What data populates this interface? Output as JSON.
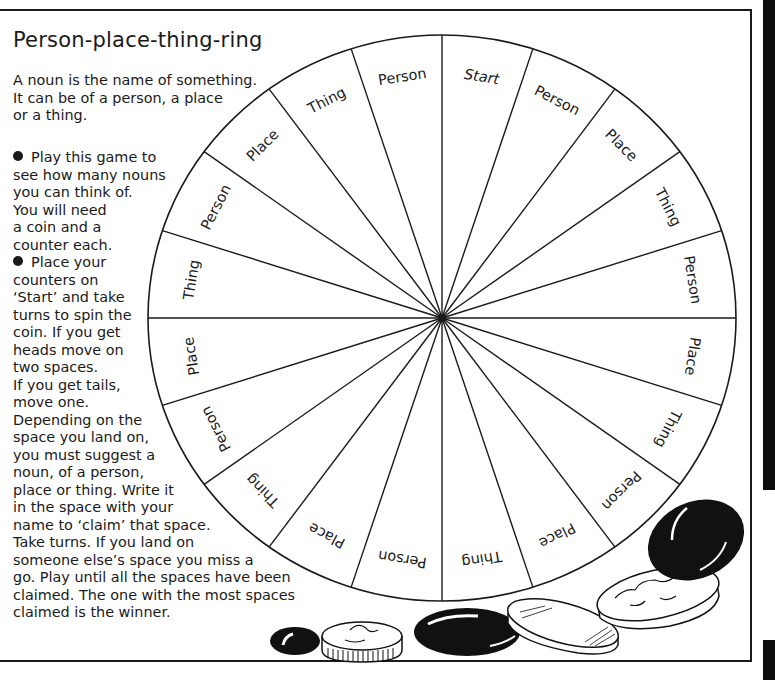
{
  "title": "Person-place-thing-ring",
  "intro_lines": [
    "A noun is the name of something.",
    "It can be of a person, a place",
    "or a thing."
  ],
  "rules_lines": [
    {
      "bullet": true,
      "text": "Play this game to"
    },
    {
      "bullet": false,
      "text": "see how many nouns"
    },
    {
      "bullet": false,
      "text": "you can think of."
    },
    {
      "bullet": false,
      "text": "You will need"
    },
    {
      "bullet": false,
      "text": "a coin and a"
    },
    {
      "bullet": false,
      "text": "counter each."
    },
    {
      "bullet": true,
      "text": "Place your"
    },
    {
      "bullet": false,
      "text": "counters on"
    },
    {
      "bullet": false,
      "text": "‘Start’ and take"
    },
    {
      "bullet": false,
      "text": "turns to spin the"
    },
    {
      "bullet": false,
      "text": "coin. If you get"
    },
    {
      "bullet": false,
      "text": "heads move on"
    },
    {
      "bullet": false,
      "text": "two spaces."
    },
    {
      "bullet": false,
      "text": "If you get tails,"
    },
    {
      "bullet": false,
      "text": "move one."
    },
    {
      "bullet": false,
      "text": "Depending on the"
    },
    {
      "bullet": false,
      "text": "space you land on,"
    },
    {
      "bullet": false,
      "text": "you must suggest a"
    },
    {
      "bullet": false,
      "text": "noun, of a person,"
    },
    {
      "bullet": false,
      "text": "place or thing. Write it"
    },
    {
      "bullet": false,
      "text": "in the space with your"
    },
    {
      "bullet": false,
      "text": "name to ‘claim’ that space."
    },
    {
      "bullet": false,
      "text": "Take turns. If you land on"
    },
    {
      "bullet": false,
      "text": "someone else’s space you miss a"
    },
    {
      "bullet": false,
      "text": "go. Play until all the spaces have been"
    },
    {
      "bullet": false,
      "text": "claimed. The one with the most spaces"
    },
    {
      "bullet": false,
      "text": "claimed is the winner."
    }
  ],
  "wheel": {
    "segments_clockwise_from_top": [
      "Start",
      "Person",
      "Place",
      "Thing",
      "Person",
      "Place",
      "Thing",
      "Person",
      "Place",
      "Thing",
      "Person",
      "Place",
      "Thing",
      "Person",
      "Place",
      "Thing",
      "Person",
      "Place",
      "Thing",
      "Person"
    ]
  },
  "decorations": {
    "items": [
      "black-counter-small",
      "silver-coin-small",
      "black-counter-large",
      "striped-coin",
      "silver-coin-large",
      "black-counter-tilted"
    ]
  },
  "colors": {
    "ink": "#1a1a1a",
    "paper": "#ffffff"
  }
}
